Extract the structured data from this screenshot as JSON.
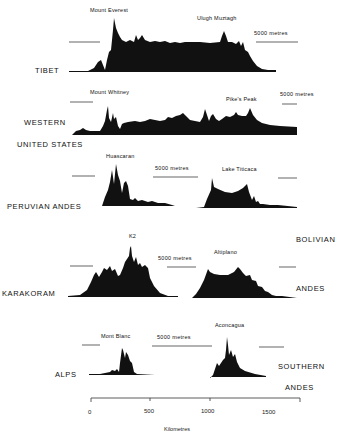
{
  "figure": {
    "profiles": [
      {
        "region": "TIBET",
        "peaks": [
          "Mount Everest",
          "Ulugh Muztagh"
        ],
        "scale_label": "5000 metres"
      },
      {
        "region_line1": "WESTERN",
        "region_line2": "UNITED STATES",
        "peaks": [
          "Mount Whitney",
          "Pike's Peak"
        ],
        "scale_label": "5000 metres"
      },
      {
        "region": "PERUVIAN ANDES",
        "peaks": [
          "Huascaran"
        ],
        "scale_label": "5000 metres"
      },
      {
        "region": "BOLIVIAN ANDES",
        "region_line1": "BOLIVIAN",
        "region_line2": "ANDES",
        "peaks": [
          "Lake Titicaca"
        ]
      },
      {
        "region": "KARAKORAM",
        "peaks": [
          "K2"
        ],
        "scale_label": "5000 metres"
      },
      {
        "region_line1": "BOLIVIAN",
        "region_line2": "ANDES",
        "peaks": [
          "Altiplano"
        ]
      },
      {
        "region": "ALPS",
        "peaks": [
          "Mont Blanc"
        ],
        "scale_label": "5000 metres"
      },
      {
        "region_line1": "SOUTHERN",
        "region_line2": "ANDES",
        "peaks": [
          "Aconcagua"
        ]
      }
    ],
    "labels": {
      "tibet": "TIBET",
      "western": "WESTERN",
      "united_states": "UNITED STATES",
      "peruvian_andes": "PERUVIAN ANDES",
      "bolivian": "BOLIVIAN",
      "andes_bolivian": "ANDES",
      "karakoram": "KARAKORAM",
      "alps": "ALPS",
      "southern": "SOUTHERN",
      "andes_southern": "ANDES"
    },
    "peaks": {
      "everest": "Mount Everest",
      "ulugh": "Ulugh Muztagh",
      "whitney": "Mount Whitney",
      "pikes": "Pike's Peak",
      "huascaran": "Huascaran",
      "titicaca": "Lake Titicaca",
      "k2": "K2",
      "altiplano": "Altiplano",
      "mont_blanc": "Mont Blanc",
      "aconcagua": "Aconcagua"
    },
    "scale_bar_label": "5000 metres",
    "axis": {
      "ticks": [
        "0",
        "500",
        "1000",
        "1500"
      ],
      "label": "Kilometres"
    }
  }
}
